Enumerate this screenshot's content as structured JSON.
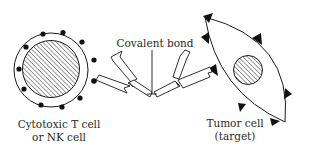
{
  "diagram": {
    "type": "biological-schematic",
    "labels": {
      "covalent_bond": "Covalent bond",
      "effector_cell_line1": "Cytotoxic T cell",
      "effector_cell_line2": "or NK cell",
      "target_cell_line1": "Tumor cell",
      "target_cell_line2": "(target)"
    },
    "nodes": [
      {
        "id": "effector-cell",
        "label": "Cytotoxic T cell or NK cell",
        "shape": "circle-with-hatched-nucleus",
        "surface_markers": "dots"
      },
      {
        "id": "antibody-left",
        "label": "",
        "shape": "Y-antibody"
      },
      {
        "id": "antibody-right",
        "label": "",
        "shape": "Y-antibody"
      },
      {
        "id": "target-cell",
        "label": "Tumor cell (target)",
        "shape": "lens-with-hatched-nucleus",
        "surface_markers": "triangles"
      }
    ],
    "edges": [
      {
        "from": "antibody-left",
        "to": "antibody-right",
        "label": "Covalent bond"
      },
      {
        "from": "antibody-left",
        "to": "effector-cell",
        "label": ""
      },
      {
        "from": "antibody-right",
        "to": "target-cell",
        "label": ""
      }
    ],
    "colors": {
      "stroke": "#1a1a1a",
      "fill": "#ffffff",
      "marker": "#111111",
      "text": "#2a2a2a"
    }
  }
}
